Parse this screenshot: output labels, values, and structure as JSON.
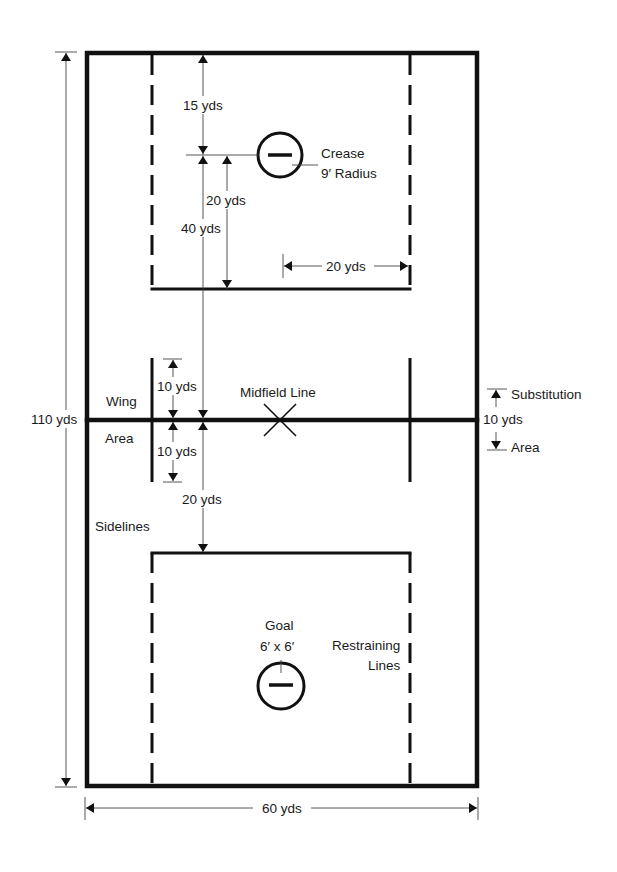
{
  "diagram": {
    "type": "lacrosse-field",
    "field": {
      "width_label": "60 yds",
      "length_label": "110 yds"
    },
    "labels": {
      "top_15": "15 yds",
      "top_20_vertical": "20 yds",
      "top_40": "40 yds",
      "top_20_horizontal": "20 yds",
      "crease_line1": "Crease",
      "crease_line2": "9′ Radius",
      "wing_10_top": "10 yds",
      "wing_10_bottom": "10 yds",
      "wing": "Wing",
      "area": "Area",
      "midfield": "Midfield Line",
      "sub_substitution": "Substitution",
      "sub_10": "10 yds",
      "sub_area": "Area",
      "mid_20": "20 yds",
      "sidelines": "Sidelines",
      "goal_line1": "Goal",
      "goal_line2": "6′ x 6′",
      "restraining_line1": "Restraining",
      "restraining_line2": "Lines",
      "length": "110 yds",
      "width": "60 yds"
    },
    "colors": {
      "line": "#111111",
      "background": "#ffffff",
      "dimension": "#444444"
    }
  }
}
